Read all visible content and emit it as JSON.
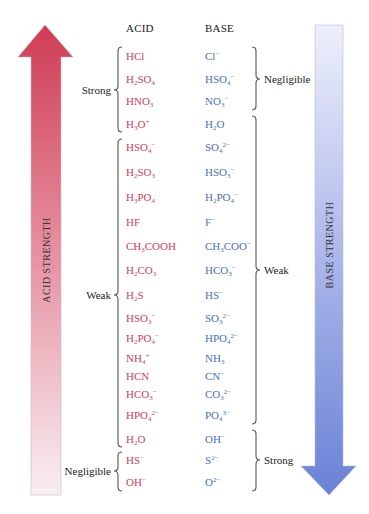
{
  "headers": {
    "acid": "ACID",
    "base": "BASE"
  },
  "arrows": {
    "acid": {
      "label": "ACID STRENGTH",
      "direction": "up",
      "color_top": "#cf3d54",
      "color_bottom": "#f7eaee"
    },
    "base": {
      "label": "BASE STRENGTH",
      "direction": "down",
      "color_top": "#ecedfa",
      "color_bottom": "#6a82d6"
    }
  },
  "colors": {
    "acid_text": "#d0405a",
    "base_text": "#4a6fc0",
    "label_text": "#222222"
  },
  "rows": [
    {
      "acid": "HCl",
      "base": "Cl⁻",
      "acid_html": "HCl",
      "base_html": "Cl<sup>−</sup>",
      "y": 56
    },
    {
      "acid": "H₂SO₄",
      "base": "HSO₄⁻",
      "acid_html": "H<sub>2</sub>SO<sub>4</sub>",
      "base_html": "HSO<sub>4</sub><sup>−</sup>",
      "y": 79
    },
    {
      "acid": "HNO₃",
      "base": "NO₃⁻",
      "acid_html": "HNO<sub>3</sub>",
      "base_html": "NO<sub>3</sub><sup>−</sup>",
      "y": 101
    },
    {
      "acid": "H₃O⁺",
      "base": "H₂O",
      "acid_html": "H<sub>3</sub>O<sup>+</sup>",
      "base_html": "H<sub>2</sub>O",
      "y": 124
    },
    {
      "acid": "HSO₄⁻",
      "base": "SO₄²⁻",
      "acid_html": "HSO<sub>4</sub><sup>−</sup>",
      "base_html": "SO<sub>4</sub><sup>2−</sup>",
      "y": 147
    },
    {
      "acid": "H₂SO₃",
      "base": "HSO₃⁻",
      "acid_html": "H<sub>2</sub>SO<sub>3</sub>",
      "base_html": "HSO<sub>3</sub><sup>−</sup>",
      "y": 172
    },
    {
      "acid": "H₃PO₄",
      "base": "H₂PO₄⁻",
      "acid_html": "H<sub>3</sub>PO<sub>4</sub>",
      "base_html": "H<sub>2</sub>PO<sub>4</sub><sup>−</sup>",
      "y": 197
    },
    {
      "acid": "HF",
      "base": "F⁻",
      "acid_html": "HF",
      "base_html": "F<sup>−</sup>",
      "y": 222
    },
    {
      "acid": "CH₃COOH",
      "base": "CH₃COO⁻",
      "acid_html": "CH<sub>3</sub>COOH",
      "base_html": "CH<sub>3</sub>COO<sup>−</sup>",
      "y": 246
    },
    {
      "acid": "H₂CO₃",
      "base": "HCO₃⁻",
      "acid_html": "H<sub>2</sub>CO<sub>3</sub>",
      "base_html": "HCO<sub>3</sub><sup>−</sup>",
      "y": 270
    },
    {
      "acid": "H₂S",
      "base": "HS⁻",
      "acid_html": "H<sub>2</sub>S",
      "base_html": "HS<sup>−</sup>",
      "y": 295
    },
    {
      "acid": "HSO₃⁻",
      "base": "SO₃²⁻",
      "acid_html": "HSO<sub>3</sub><sup>−</sup>",
      "base_html": "SO<sub>3</sub><sup>2−</sup>",
      "y": 318
    },
    {
      "acid": "H₂PO₄⁻",
      "base": "HPO₄²⁻",
      "acid_html": "H<sub>2</sub>PO<sub>4</sub><sup>−</sup>",
      "base_html": "HPO<sub>4</sub><sup>2−</sup>",
      "y": 338
    },
    {
      "acid": "NH₄⁺",
      "base": "NH₃",
      "acid_html": "NH<sub>4</sub><sup>+</sup>",
      "base_html": "NH<sub>3</sub>",
      "y": 358
    },
    {
      "acid": "HCN",
      "base": "CN⁻",
      "acid_html": "HCN",
      "base_html": "CN<sup>−</sup>",
      "y": 376
    },
    {
      "acid": "HCO₃⁻",
      "base": "CO₃²⁻",
      "acid_html": "HCO<sub>3</sub><sup>−</sup>",
      "base_html": "CO<sub>3</sub><sup>2−</sup>",
      "y": 394
    },
    {
      "acid": "HPO₄²⁻",
      "base": "PO₄³⁻",
      "acid_html": "HPO<sub>4</sub><sup>2−</sup>",
      "base_html": "PO<sub>4</sub><sup>3−</sup>",
      "y": 415
    },
    {
      "acid": "H₂O",
      "base": "OH⁻",
      "acid_html": "H<sub>2</sub>O",
      "base_html": "OH<sup>−</sup>",
      "y": 439
    },
    {
      "acid": "HS⁻",
      "base": "S²⁻",
      "acid_html": "HS<sup>−</sup>",
      "base_html": "S<sup>2−</sup>",
      "y": 460
    },
    {
      "acid": "OH⁻",
      "base": "O²⁻",
      "acid_html": "OH<sup>−</sup>",
      "base_html": "O<sup>2−</sup>",
      "y": 482
    }
  ],
  "acid_groups": [
    {
      "label": "Strong",
      "from_row": 0,
      "to_row": 3,
      "top": 47,
      "bottom": 132,
      "mid": 90
    },
    {
      "label": "Weak",
      "from_row": 4,
      "to_row": 17,
      "top": 139,
      "bottom": 447,
      "mid": 295
    },
    {
      "label": "Negligible",
      "from_row": 18,
      "to_row": 19,
      "top": 452,
      "bottom": 491,
      "mid": 471
    }
  ],
  "base_groups": [
    {
      "label": "Negligible",
      "from_row": 0,
      "to_row": 2,
      "top": 47,
      "bottom": 110,
      "mid": 79
    },
    {
      "label": "Weak",
      "from_row": 3,
      "to_row": 16,
      "top": 116,
      "bottom": 424,
      "mid": 270
    },
    {
      "label": "Strong",
      "from_row": 17,
      "to_row": 19,
      "top": 430,
      "bottom": 491,
      "mid": 460
    }
  ]
}
